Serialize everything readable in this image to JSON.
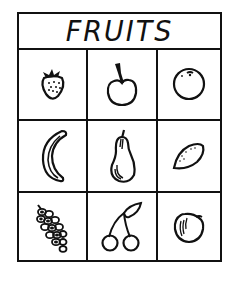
{
  "title": "FRUITS",
  "cells": [
    {
      "row": 1,
      "col": 1,
      "icon": "strawberry-icon",
      "label": "strawberry"
    },
    {
      "row": 1,
      "col": 2,
      "icon": "apple-icon",
      "label": "apple"
    },
    {
      "row": 1,
      "col": 3,
      "icon": "orange-icon",
      "label": "orange"
    },
    {
      "row": 2,
      "col": 1,
      "icon": "banana-icon",
      "label": "banana"
    },
    {
      "row": 2,
      "col": 2,
      "icon": "pear-icon",
      "label": "pear"
    },
    {
      "row": 2,
      "col": 3,
      "icon": "lemon-icon",
      "label": "lemon"
    },
    {
      "row": 3,
      "col": 1,
      "icon": "grapes-icon",
      "label": "grapes"
    },
    {
      "row": 3,
      "col": 2,
      "icon": "cherries-icon",
      "label": "cherries"
    },
    {
      "row": 3,
      "col": 3,
      "icon": "peach-icon",
      "label": "peach"
    }
  ],
  "colors": {
    "ink": "#111111",
    "paper": "#ffffff"
  }
}
